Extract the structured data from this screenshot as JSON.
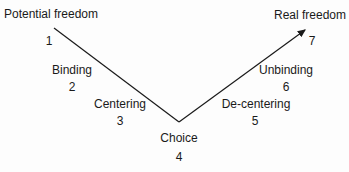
{
  "diagram": {
    "type": "v-shaped-path",
    "nodes": [
      {
        "label": "Potential freedom",
        "number": "1"
      },
      {
        "label": "Binding",
        "number": "2"
      },
      {
        "label": "Centering",
        "number": "3"
      },
      {
        "label": "Choice",
        "number": "4"
      },
      {
        "label": "De-centering",
        "number": "5"
      },
      {
        "label": "Unbinding",
        "number": "6"
      },
      {
        "label": "Real freedom",
        "number": "7"
      }
    ],
    "line_color": "#1a1a1a"
  }
}
